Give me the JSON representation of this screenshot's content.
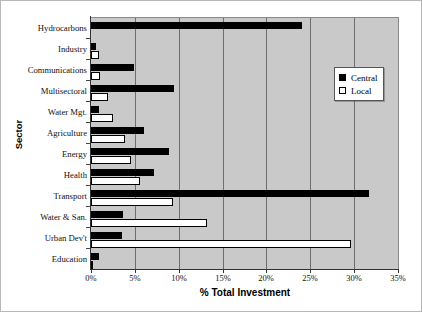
{
  "chart_data": {
    "type": "bar",
    "orientation": "horizontal",
    "title": "",
    "xlabel": "% Total Investment",
    "ylabel": "Sector",
    "xlim": [
      0,
      35
    ],
    "xticks": [
      0,
      5,
      10,
      15,
      20,
      25,
      30,
      35
    ],
    "xtick_labels": [
      "0%",
      "5%",
      "10%",
      "15%",
      "20%",
      "25%",
      "30%",
      "35%"
    ],
    "grid": true,
    "grid_axis": "x",
    "legend_position": "upper right",
    "categories": [
      "Hydrocarbons",
      "Industry",
      "Communications",
      "Multisectoral",
      "Water Mgt.",
      "Agriculture",
      "Energy",
      "Health",
      "Transport",
      "Water & San.",
      "Urban Dev't",
      "Education"
    ],
    "series": [
      {
        "name": "Central",
        "color": "#000000",
        "values": [
          24.0,
          0.6,
          4.9,
          9.5,
          0.9,
          6.0,
          8.9,
          7.2,
          31.7,
          3.6,
          3.5,
          0.9
        ]
      },
      {
        "name": "Local",
        "color": "#ffffff",
        "values": [
          0.0,
          0.9,
          1.0,
          1.9,
          2.5,
          3.9,
          4.6,
          5.6,
          9.3,
          13.2,
          29.6,
          0.2
        ]
      }
    ],
    "plot_background": "#c9c9c9"
  },
  "legend": {
    "entries": [
      {
        "label": "Central",
        "swatch": "filled-square-icon"
      },
      {
        "label": "Local",
        "swatch": "hollow-square-icon"
      }
    ]
  }
}
